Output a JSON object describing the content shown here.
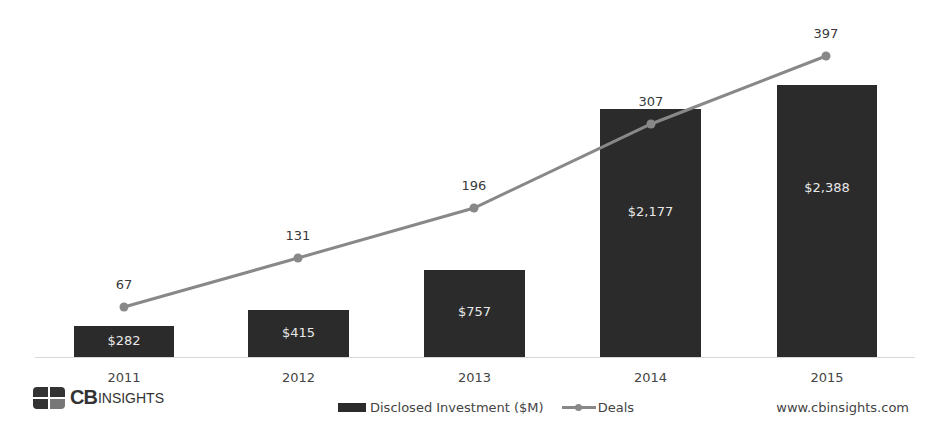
{
  "chart_data": {
    "type": "bar+line",
    "title": "",
    "categories": [
      "2011",
      "2012",
      "2013",
      "2014",
      "2015"
    ],
    "series": [
      {
        "name": "Disclosed Investment ($M)",
        "type": "bar",
        "values": [
          282,
          415,
          757,
          2177,
          2388
        ],
        "labels": [
          "$282",
          "$415",
          "$757",
          "$2,177",
          "$2,388"
        ],
        "color": "#2b2b2b"
      },
      {
        "name": "Deals",
        "type": "line",
        "values": [
          67,
          131,
          196,
          307,
          397
        ],
        "labels": [
          "67",
          "131",
          "196",
          "307",
          "397"
        ],
        "color": "#888888"
      }
    ],
    "xlabel": "",
    "ylabel": "",
    "grid": false,
    "legend_position": "bottom"
  },
  "geometry": {
    "baseline_y": 357,
    "bars": [
      {
        "x": 74,
        "w": 100,
        "top": 326
      },
      {
        "x": 248,
        "w": 101,
        "top": 310
      },
      {
        "x": 424,
        "w": 101,
        "top": 270
      },
      {
        "x": 600,
        "w": 101,
        "top": 109
      },
      {
        "x": 777,
        "w": 100,
        "top": 85
      }
    ],
    "points": [
      {
        "x": 124,
        "y": 307
      },
      {
        "x": 298,
        "y": 258
      },
      {
        "x": 474,
        "y": 208
      },
      {
        "x": 651,
        "y": 124
      },
      {
        "x": 826,
        "y": 56
      }
    ]
  },
  "branding": {
    "logo_bold": "CB",
    "logo_text": "INSIGHTS",
    "website": "www.cbinsights.com"
  },
  "legend": {
    "bar_label": "Disclosed Investment ($M)",
    "line_label": "Deals"
  }
}
